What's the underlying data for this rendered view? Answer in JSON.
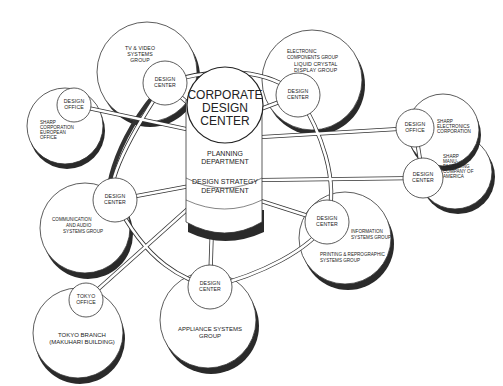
{
  "center": {
    "title_lines": [
      "CORPORATE",
      "DESIGN",
      "CENTER"
    ],
    "planning_lines": [
      "PLANNING",
      "DEPARTMENT"
    ],
    "strategy_lines": [
      "DESIGN  STRATEGY",
      "DEPARTMENT"
    ]
  },
  "groups": {
    "tv_video": {
      "group_lines": [
        "TV & VIDEO",
        "SYSTEMS",
        "GROUP"
      ],
      "hub_lines": [
        "DESIGN",
        "CENTER"
      ]
    },
    "electronic": {
      "group_lines": [
        "ELECTRONIC",
        "COMPONENTS GROUP",
        "LIQUID CRYSTAL",
        "DISPLAY GROUP"
      ],
      "hub_lines": [
        "DESIGN",
        "CENTER"
      ]
    },
    "europe": {
      "group_lines": [
        "SHARP",
        "CORPORATION",
        "EUROPEAN",
        "OFFICE"
      ],
      "hub_lines": [
        "DESIGN",
        "OFFICE"
      ]
    },
    "sharp_electronics": {
      "group_lines": [
        "SHARP",
        "ELECTRONICS",
        "CORPORATION"
      ],
      "hub_lines": [
        "DESIGN",
        "OFFICE"
      ]
    },
    "sharp_america": {
      "group_lines": [
        "SHARP",
        "MANU-",
        "FACTURING",
        "COMPANY OF",
        "AMERICA"
      ],
      "hub_lines": [
        "DESIGN",
        "CENTER"
      ]
    },
    "communication": {
      "group_lines": [
        "COMMUNICATION",
        "AND AUDIO",
        "SYSTEMS GROUP"
      ],
      "hub_lines": [
        "DESIGN",
        "CENTER"
      ]
    },
    "information": {
      "group_lines": [
        "INFORMATION",
        "SYSTEMS GROUP"
      ],
      "group2_lines": [
        "PRINTING & REPROGRAPHIC",
        "SYSTEMS GROUP"
      ],
      "hub_lines": [
        "DESIGN",
        "CENTER"
      ]
    },
    "appliance": {
      "group_lines": [
        "APPLIANCE  SYSTEMS",
        "GROUP"
      ],
      "hub_lines": [
        "DESIGN",
        "CENTER"
      ]
    },
    "tokyo": {
      "group_lines": [
        "TOKYO  BRANCH",
        "(MAKUHARI BUILDING)"
      ],
      "hub_lines": [
        "TOKYO",
        "OFFICE"
      ]
    }
  }
}
